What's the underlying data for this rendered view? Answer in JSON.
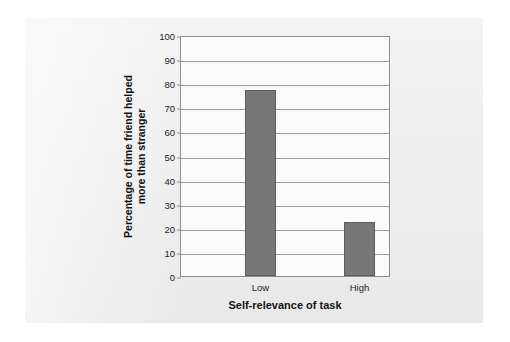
{
  "chart_data": {
    "type": "bar",
    "title": "",
    "subtitle": "",
    "categories": [
      "Low",
      "High"
    ],
    "values": [
      77,
      22.5
    ],
    "series": [
      {
        "name": "Percentage of time friend helped more than stranger",
        "values": [
          77,
          22.5
        ]
      }
    ],
    "xlabel": "Self-relevance of task",
    "ylabel": "Percentage of time friend helped more than stranger",
    "ylabel_lines": [
      "Percentage of time friend helped",
      "more than stranger"
    ],
    "ylim": [
      0,
      100
    ],
    "ytick_step": 10,
    "yticks": [
      0,
      10,
      20,
      30,
      40,
      50,
      60,
      70,
      80,
      90,
      100
    ],
    "ytick_labels": [
      "0",
      "10",
      "20",
      "30",
      "40",
      "50",
      "60",
      "70",
      "80",
      "90",
      "100"
    ],
    "grid": true,
    "grid_axis": "y",
    "legend": false,
    "legend_position": "none",
    "bar_color": "#777777",
    "bar_border_color": "#5d5d5d",
    "plot_background": "#fafafa",
    "frame_color": "#8d8d8d",
    "gridline_color": "#9a9a9a",
    "panel_background": "#ededed",
    "page_background": "#ffffff"
  }
}
